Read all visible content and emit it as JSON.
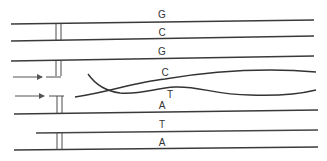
{
  "diagram": {
    "type": "DNA replication / strand displacement schematic",
    "colors": {
      "stroke": "#3a3a3a",
      "background": "#ffffff"
    },
    "base_labels": [
      {
        "id": "g1",
        "text": "G",
        "x": 162,
        "y": 18
      },
      {
        "id": "c1",
        "text": "C",
        "x": 162,
        "y": 36
      },
      {
        "id": "g2",
        "text": "G",
        "x": 162,
        "y": 55
      },
      {
        "id": "c2",
        "text": "C",
        "x": 165,
        "y": 75
      },
      {
        "id": "t1",
        "text": "T",
        "x": 170,
        "y": 97
      },
      {
        "id": "a1",
        "text": "A",
        "x": 162,
        "y": 109
      },
      {
        "id": "t2",
        "text": "T",
        "x": 162,
        "y": 128
      },
      {
        "id": "a2",
        "text": "A",
        "x": 162,
        "y": 146
      }
    ],
    "strands": [
      {
        "id": "strand-1",
        "label": "G"
      },
      {
        "id": "strand-2",
        "label": "C"
      },
      {
        "id": "strand-3",
        "label": "G"
      },
      {
        "id": "strand-4-curved",
        "label": "C"
      },
      {
        "id": "strand-5-curved",
        "label": "T"
      },
      {
        "id": "strand-6",
        "label": "A"
      },
      {
        "id": "strand-7",
        "label": "T"
      },
      {
        "id": "strand-8",
        "label": "A"
      }
    ],
    "arrows": [
      {
        "id": "arrow-upper",
        "direction": "right"
      },
      {
        "id": "arrow-lower",
        "direction": "right"
      }
    ]
  }
}
